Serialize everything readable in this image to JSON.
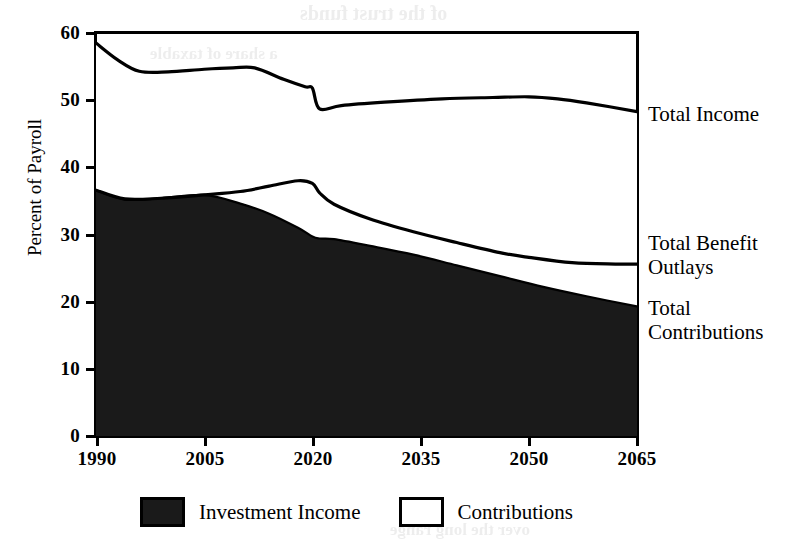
{
  "chart_data": {
    "type": "area",
    "title": "",
    "xlabel": "",
    "ylabel": "Percent of Payroll",
    "xlim": [
      1990,
      2065
    ],
    "ylim": [
      0,
      60
    ],
    "ytick_values": [
      60,
      50,
      40,
      30,
      20,
      10,
      0
    ],
    "ytick_labels": [
      "60",
      "50",
      "40",
      "30",
      "20",
      "10",
      "0"
    ],
    "xtick_values": [
      1990,
      2005,
      2020,
      2035,
      2050,
      2065
    ],
    "xtick_labels": [
      "1990",
      "2005",
      "2020",
      "2035",
      "2050",
      "2065"
    ],
    "grid": false,
    "legend_position": "bottom",
    "stacking": "Contributions band is stacked on top of the Investment Income band; Total Income is the upper boundary of the stack",
    "series": [
      {
        "name": "Total Income",
        "role": "upper-boundary-line",
        "x": [
          1990,
          1993,
          1996,
          2000,
          2005,
          2009,
          2012,
          2016,
          2019,
          2020,
          2021,
          2024,
          2030,
          2038,
          2045,
          2050,
          2054,
          2058,
          2065
        ],
        "values": [
          58.5,
          56.0,
          54.3,
          54.2,
          54.6,
          54.8,
          54.8,
          53.1,
          52.0,
          51.8,
          48.7,
          49.2,
          49.7,
          50.2,
          50.4,
          50.5,
          50.2,
          49.6,
          48.3
        ]
      },
      {
        "name": "Total Benefit Outlays",
        "role": "boundary-line",
        "x": [
          1990,
          1994,
          1999,
          2005,
          2010,
          2014,
          2018,
          2020,
          2021,
          2023,
          2028,
          2034,
          2040,
          2046,
          2050,
          2056,
          2062,
          2065
        ],
        "values": [
          36.6,
          35.3,
          35.4,
          35.9,
          36.4,
          37.2,
          38.0,
          37.6,
          36.2,
          34.5,
          32.3,
          30.4,
          28.8,
          27.3,
          26.6,
          25.8,
          25.6,
          25.6
        ]
      },
      {
        "name": "Total Contributions",
        "role": "filled-area-top",
        "x": [
          1990,
          1994,
          1999,
          2005,
          2010,
          2014,
          2018,
          2020,
          2021,
          2023,
          2028,
          2034,
          2040,
          2046,
          2052,
          2058,
          2065
        ],
        "values": [
          36.6,
          35.2,
          35.4,
          35.9,
          34.6,
          33.1,
          31.0,
          29.7,
          29.4,
          29.3,
          28.3,
          27.0,
          25.4,
          23.8,
          22.2,
          20.8,
          19.3
        ]
      }
    ],
    "bands": [
      {
        "name": "Investment Income",
        "fill": "#1a1a1a",
        "lower": "zero-baseline",
        "upper": "Total Contributions"
      },
      {
        "name": "Contributions",
        "fill": "#ffffff",
        "lower": "Total Contributions",
        "upper": "Total Income"
      }
    ]
  },
  "axes": {
    "y_title": "Percent of Payroll",
    "y_ticks": [
      "60",
      "50",
      "40",
      "30",
      "20",
      "10",
      "0"
    ],
    "x_ticks": [
      "1990",
      "2005",
      "2020",
      "2035",
      "2050",
      "2065"
    ]
  },
  "callouts": {
    "total_income": "Total Income",
    "total_benefit_outlays": "Total Benefit\nOutlays",
    "total_contributions": "Total\nContributions"
  },
  "legend": {
    "items": [
      {
        "label": "Investment Income",
        "swatch": "filled",
        "color": "#1a1a1a"
      },
      {
        "label": "Contributions",
        "swatch": "hollow",
        "color": "#ffffff"
      }
    ]
  },
  "ghost_text": {
    "lines": [
      "of the trust funds",
      "a share of taxable",
      "the projected",
      "benefits scheduled",
      "payroll tax rate",
      "over the long range"
    ]
  },
  "colors": {
    "ink": "#000000",
    "fill_dark": "#1a1a1a",
    "fill_light": "#ffffff",
    "page": "#ffffff"
  }
}
